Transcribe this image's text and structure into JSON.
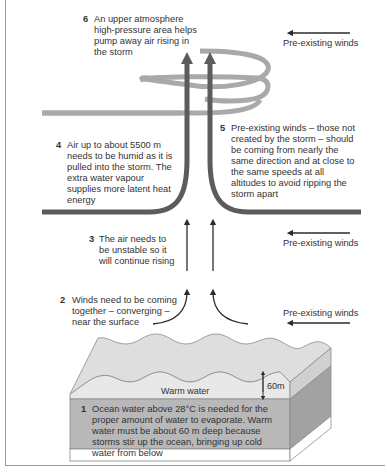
{
  "diagram": {
    "title_cut": "",
    "steps": [
      {
        "num": "1",
        "text": "Ocean water above 28°C is needed for the proper amount of water to evaporate. Warm water must be about 60 m deep because storms stir up the ocean, bringing up cold water from below"
      },
      {
        "num": "2",
        "text": "Winds need to be coming together – converging – near the surface"
      },
      {
        "num": "3",
        "text": "The air needs to be unstable so it will continue rising"
      },
      {
        "num": "4",
        "text": "Air up to about 5500 m needs to be humid as it is pulled into the storm. The extra water vapour supplies more latent heat energy"
      },
      {
        "num": "5",
        "text": "Pre-existing winds – those not created by the storm – should be coming from nearly the same direction and at close to the same speeds at all altitudes to avoid ripping the storm apart"
      },
      {
        "num": "6",
        "text": "An upper atmosphere high-pressure area helps pump away air rising in the storm"
      }
    ],
    "wind_labels": [
      "Pre-existing winds",
      "Pre-existing winds",
      "Pre-existing winds"
    ],
    "ocean": {
      "warm_water_label": "Warm water",
      "depth_label": "60m"
    },
    "colors": {
      "upper_flow": "#a9a9a9",
      "lower_flow": "#5c5c5c",
      "arrows": "#2b2b2b",
      "ocean_top": "#dedede",
      "ocean_front_warm": "#e6e6e6",
      "ocean_front_deep": "#b8b8b8",
      "ocean_side": "#9f9f9f"
    }
  }
}
